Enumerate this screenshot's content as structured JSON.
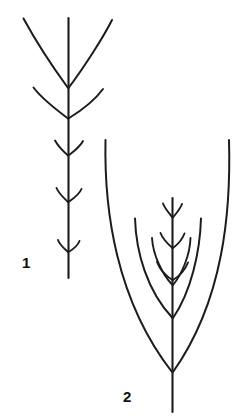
{
  "plate": {
    "background_color": "#ffffff",
    "ink_color": "#1c1c1c",
    "width": 245,
    "height": 416
  },
  "figures": [
    {
      "label": "1",
      "name": "figure-1-branching-axis",
      "description": "Slender erect axis bearing five opposite pairs of branches that decrease in size from the apex downward",
      "stem": {
        "x": 68,
        "top_y": 18,
        "bottom_y": 278
      },
      "branch_pairs": [
        {
          "node_y": 88,
          "span": "large",
          "tip_left": [
            24,
            18
          ],
          "tip_right": [
            112,
            20
          ]
        },
        {
          "node_y": 118,
          "span": "medium",
          "tip_left": [
            34,
            88
          ],
          "tip_right": [
            103,
            90
          ]
        },
        {
          "node_y": 155,
          "span": "small",
          "tip_left": [
            54,
            140
          ],
          "tip_right": [
            83,
            141
          ]
        },
        {
          "node_y": 200,
          "span": "small",
          "tip_left": [
            56,
            188
          ],
          "tip_right": [
            81,
            189
          ]
        },
        {
          "node_y": 250,
          "span": "small",
          "tip_left": [
            58,
            240
          ],
          "tip_right": [
            79,
            241
          ]
        }
      ]
    },
    {
      "label": "2",
      "name": "figure-2-branching-axis",
      "description": "Axis with three successive pairs of long arching branches converging toward the base, plus three small apical branch pairs",
      "stem": {
        "x": 172,
        "top_y": 198,
        "bottom_y": 412
      },
      "arching_pairs": [
        {
          "node_y": 372,
          "tip_left": [
            106,
            140
          ],
          "tip_right": [
            229,
            140
          ]
        },
        {
          "node_y": 318,
          "tip_left": [
            135,
            219
          ],
          "tip_right": [
            201,
            219
          ]
        },
        {
          "node_y": 285,
          "tip_left": [
            152,
            238
          ],
          "tip_right": [
            190,
            238
          ]
        }
      ],
      "apical_pairs": [
        {
          "node_y": 218,
          "span": "small"
        },
        {
          "node_y": 248,
          "span": "small"
        },
        {
          "node_y": 278,
          "span": "small"
        }
      ]
    }
  ],
  "labels": {
    "figure_one": "1",
    "figure_two": "2"
  }
}
